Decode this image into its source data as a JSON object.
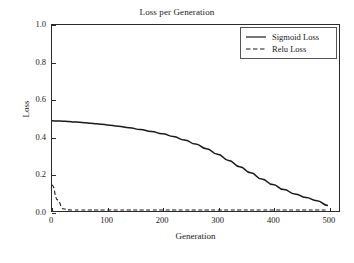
{
  "chart_data": {
    "type": "line",
    "title": "Loss per Generation",
    "xlabel": "Generation",
    "ylabel": "Loss",
    "xlim": [
      0,
      520
    ],
    "ylim": [
      0,
      1.0
    ],
    "xticks": [
      0,
      100,
      200,
      300,
      400,
      500
    ],
    "xtick_labels": [
      "0",
      "100",
      "200",
      "300",
      "400",
      "500"
    ],
    "yticks": [
      0.0,
      0.2,
      0.4,
      0.6,
      0.8,
      1.0
    ],
    "ytick_labels": [
      "0.0",
      "0.2",
      "0.4",
      "0.6",
      "0.8",
      "1.0"
    ],
    "grid": false,
    "legend_position": "upper right",
    "x": [
      0,
      10,
      20,
      30,
      40,
      50,
      60,
      70,
      80,
      90,
      100,
      120,
      140,
      160,
      180,
      200,
      220,
      240,
      260,
      280,
      300,
      320,
      340,
      360,
      380,
      400,
      420,
      440,
      460,
      480,
      500
    ],
    "series": [
      {
        "name": "Sigmoid Loss",
        "style": "solid",
        "color": "#1a1a1a",
        "values": [
          0.485,
          0.484,
          0.483,
          0.481,
          0.479,
          0.477,
          0.475,
          0.472,
          0.469,
          0.466,
          0.463,
          0.456,
          0.448,
          0.438,
          0.428,
          0.415,
          0.4,
          0.382,
          0.36,
          0.335,
          0.305,
          0.272,
          0.238,
          0.205,
          0.172,
          0.142,
          0.115,
          0.092,
          0.072,
          0.055,
          0.03
        ]
      },
      {
        "name": "Relu Loss",
        "style": "dashed",
        "color": "#1a1a1a",
        "values": [
          0.14,
          0.06,
          0.012,
          0.006,
          0.005,
          0.005,
          0.005,
          0.005,
          0.005,
          0.005,
          0.005,
          0.005,
          0.005,
          0.005,
          0.005,
          0.005,
          0.005,
          0.005,
          0.005,
          0.005,
          0.005,
          0.005,
          0.005,
          0.005,
          0.005,
          0.005,
          0.005,
          0.005,
          0.005,
          0.005,
          0.005
        ]
      }
    ]
  },
  "legend": {
    "items": [
      {
        "label": "Sigmoid Loss"
      },
      {
        "label": "Relu Loss"
      }
    ]
  }
}
